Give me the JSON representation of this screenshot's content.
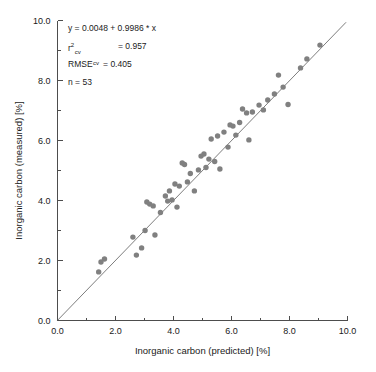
{
  "chart_data": {
    "type": "scatter",
    "title": "",
    "xlabel": "Inorganic carbon (predicted) [%]",
    "ylabel": "Inorganic carbon (measured) [%]",
    "xlim": [
      0.0,
      10.0
    ],
    "ylim": [
      0.0,
      10.0
    ],
    "x_ticks": [
      "0.0",
      "2.0",
      "4.0",
      "6.0",
      "8.0",
      "10.0"
    ],
    "y_ticks": [
      "0.0",
      "2.0",
      "4.0",
      "6.0",
      "8.0",
      "10.0"
    ],
    "x_tick_values": [
      0.0,
      2.0,
      4.0,
      6.0,
      8.0,
      10.0
    ],
    "y_tick_values": [
      0.0,
      2.0,
      4.0,
      6.0,
      8.0,
      10.0
    ],
    "minor_tick_interval": 1.0,
    "grid": false,
    "legend": "none",
    "marker_color": "#808080",
    "line_color": "#6e6e6e",
    "series": [
      {
        "name": "samples",
        "n": 53,
        "points": [
          [
            1.42,
            1.62
          ],
          [
            1.5,
            1.95
          ],
          [
            1.62,
            2.05
          ],
          [
            2.6,
            2.78
          ],
          [
            2.72,
            2.18
          ],
          [
            2.9,
            2.42
          ],
          [
            3.02,
            3.0
          ],
          [
            3.08,
            3.95
          ],
          [
            3.18,
            3.88
          ],
          [
            3.3,
            3.82
          ],
          [
            3.36,
            2.85
          ],
          [
            3.55,
            3.6
          ],
          [
            3.72,
            4.15
          ],
          [
            3.8,
            3.98
          ],
          [
            3.86,
            4.32
          ],
          [
            3.95,
            4.02
          ],
          [
            4.05,
            4.55
          ],
          [
            4.12,
            3.78
          ],
          [
            4.2,
            4.48
          ],
          [
            4.3,
            5.25
          ],
          [
            4.38,
            5.2
          ],
          [
            4.48,
            4.62
          ],
          [
            4.58,
            4.9
          ],
          [
            4.72,
            4.32
          ],
          [
            4.86,
            5.02
          ],
          [
            4.95,
            5.48
          ],
          [
            5.05,
            5.55
          ],
          [
            5.12,
            5.1
          ],
          [
            5.22,
            5.38
          ],
          [
            5.3,
            6.05
          ],
          [
            5.42,
            5.3
          ],
          [
            5.52,
            6.15
          ],
          [
            5.6,
            5.05
          ],
          [
            5.74,
            6.28
          ],
          [
            5.88,
            5.78
          ],
          [
            5.95,
            6.52
          ],
          [
            6.05,
            6.48
          ],
          [
            6.15,
            6.18
          ],
          [
            6.28,
            6.6
          ],
          [
            6.38,
            7.05
          ],
          [
            6.52,
            6.92
          ],
          [
            6.6,
            6.02
          ],
          [
            6.72,
            6.95
          ],
          [
            6.95,
            7.18
          ],
          [
            7.1,
            7.02
          ],
          [
            7.25,
            7.35
          ],
          [
            7.48,
            7.55
          ],
          [
            7.62,
            8.18
          ],
          [
            7.78,
            7.78
          ],
          [
            7.95,
            7.2
          ],
          [
            8.38,
            8.42
          ],
          [
            8.6,
            8.72
          ],
          [
            9.05,
            9.18
          ]
        ]
      }
    ],
    "fit_line": {
      "kind": "1:1 regression line",
      "intercept": 0.0048,
      "slope": 0.9986,
      "x_start": 0.0,
      "x_end": 9.95
    },
    "annotations": {
      "equation": "y = 0.0048 + 0.9986 * x",
      "r2_label": "r",
      "r2_sup": "2",
      "r2_sub": "cv",
      "r2_value": "= 0.957",
      "rmse_label": "RMSE",
      "rmse_sub": "cv",
      "rmse_value": "= 0.405",
      "n_text": "n = 53"
    }
  }
}
